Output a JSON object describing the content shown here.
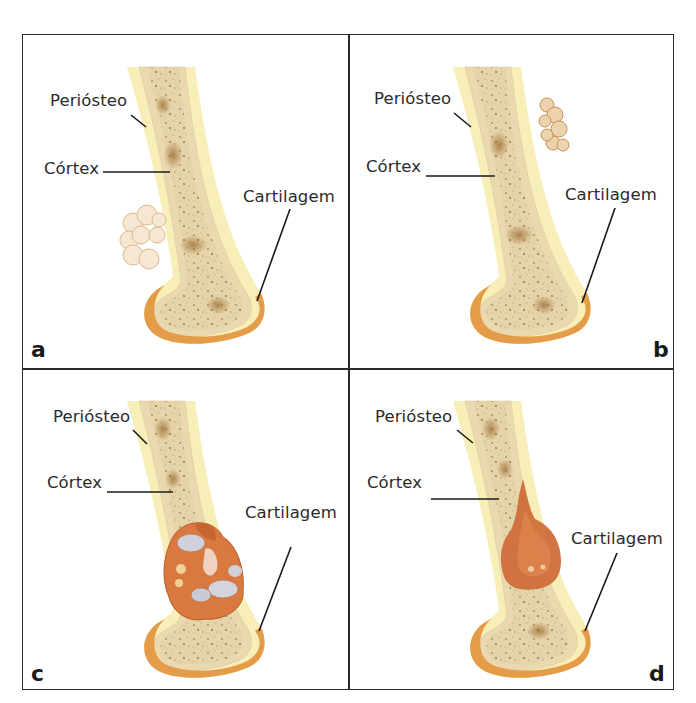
{
  "figure": {
    "panels": [
      {
        "id": "a",
        "letter": "a",
        "labels": {
          "periosteum": "Periósteo",
          "cortex": "Córtex",
          "cartilage": "Cartilagem"
        },
        "lesion": "surface cauliflower tumor on left side of shaft (pale cream)"
      },
      {
        "id": "b",
        "letter": "b",
        "labels": {
          "periosteum": "Periósteo",
          "cortex": "Córtex",
          "cartilage": "Cartilagem"
        },
        "lesion": "surface lobulated tumor on right side of shaft (tan)"
      },
      {
        "id": "c",
        "letter": "c",
        "labels": {
          "periosteum": "Periósteo",
          "cortex": "Córtex",
          "cartilage": "Cartilagem"
        },
        "lesion": "intramedullary lobulated tumor with grey-white cartilage islands and orange tissue"
      },
      {
        "id": "d",
        "letter": "d",
        "labels": {
          "periosteum": "Periósteo",
          "cortex": "Córtex",
          "cartilage": "Cartilagem"
        },
        "lesion": "intramedullary reddish-orange infiltrating tumor"
      }
    ],
    "colors": {
      "border": "#2a2a2a",
      "periosteum": "#f6ecb0",
      "cortex": "#e8dbb4",
      "medulla": "#e3cfa5",
      "speckle": "#a67a3e",
      "cartilage": "#e39a45",
      "tumor_pale": "#f2e3cc",
      "tumor_orange": "#d8743a",
      "tumor_grey": "#c9cbd6",
      "tumor_red": "#cf6a38"
    }
  }
}
